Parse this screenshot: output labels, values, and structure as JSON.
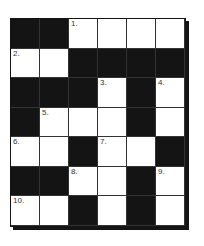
{
  "puzzle": {
    "type": "crossword",
    "cols": 6,
    "rows": 7,
    "grid": [
      [
        "B",
        "B",
        "W",
        "W",
        "W",
        "W"
      ],
      [
        "W",
        "W",
        "B",
        "B",
        "B",
        "B"
      ],
      [
        "B",
        "B",
        "B",
        "W",
        "B",
        "W"
      ],
      [
        "B",
        "W",
        "W",
        "W",
        "B",
        "W"
      ],
      [
        "W",
        "W",
        "B",
        "W",
        "W",
        "B"
      ],
      [
        "B",
        "B",
        "W",
        "W",
        "B",
        "W"
      ],
      [
        "W",
        "W",
        "B",
        "W",
        "B",
        "W"
      ]
    ],
    "numbers": [
      [
        "",
        "",
        "1.",
        "",
        "",
        ""
      ],
      [
        "2.",
        "",
        "",
        "",
        "",
        ""
      ],
      [
        "",
        "",
        "",
        "3.",
        "",
        "4."
      ],
      [
        "",
        "5.",
        "",
        "",
        "",
        ""
      ],
      [
        "6.",
        "",
        "",
        "7.",
        "",
        ""
      ],
      [
        "",
        "",
        "8.",
        "",
        "",
        "9."
      ],
      [
        "10.",
        "",
        "",
        "",
        "",
        ""
      ]
    ],
    "colors": {
      "black": "#141414",
      "white": "#ffffff"
    }
  }
}
